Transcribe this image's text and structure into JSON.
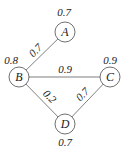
{
  "diagram": {
    "type": "weighted-graph",
    "nodes": [
      {
        "id": "A",
        "label": "A",
        "weight": "0.7",
        "x": 65,
        "y": 32
      },
      {
        "id": "B",
        "label": "B",
        "weight": "0.8",
        "x": 19,
        "y": 77
      },
      {
        "id": "C",
        "label": "C",
        "weight": "0.9",
        "x": 110,
        "y": 77
      },
      {
        "id": "D",
        "label": "D",
        "weight": "0.7",
        "x": 65,
        "y": 124
      }
    ],
    "edges": [
      {
        "from": "A",
        "to": "B",
        "weight": "0.7"
      },
      {
        "from": "B",
        "to": "C",
        "weight": "0.9"
      },
      {
        "from": "B",
        "to": "D",
        "weight": "0.2"
      },
      {
        "from": "D",
        "to": "C",
        "weight": "0.7"
      }
    ]
  }
}
